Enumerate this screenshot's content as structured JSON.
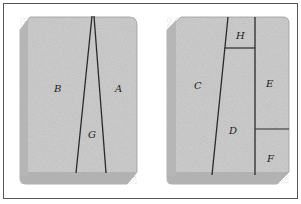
{
  "diagram": {
    "title": "",
    "colors": {
      "slab_fill": "#c9c9c9",
      "slab_edge": "#9e9e9e",
      "line": "#2a2a2a",
      "frame": "#555555"
    },
    "slabs": [
      {
        "name": "left-slab",
        "regions": [
          {
            "label": "B",
            "x": 54,
            "y": 89
          },
          {
            "label": "A",
            "x": 117,
            "y": 89
          },
          {
            "label": "G",
            "x": 90,
            "y": 135
          }
        ]
      },
      {
        "name": "right-slab",
        "regions": [
          {
            "label": "C",
            "x": 197,
            "y": 86
          },
          {
            "label": "H",
            "x": 239,
            "y": 36
          },
          {
            "label": "E",
            "x": 268,
            "y": 84
          },
          {
            "label": "D",
            "x": 232,
            "y": 131
          },
          {
            "label": "F",
            "x": 269,
            "y": 159
          }
        ]
      }
    ]
  }
}
